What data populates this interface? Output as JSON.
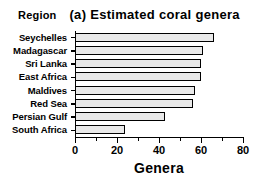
{
  "figure": {
    "panel_label": "(a)",
    "y_axis_title": "Region",
    "title": "(a) Estimated coral genera"
  },
  "chart_data": {
    "type": "bar",
    "orientation": "horizontal",
    "title": "(a) Estimated coral genera",
    "xlabel": "Genera",
    "ylabel": "Region",
    "categories": [
      "Seychelles",
      "Madagascar",
      "Sri Lanka",
      "East Africa",
      "Maldives",
      "Red Sea",
      "Persian Gulf",
      "South Africa"
    ],
    "values": [
      66,
      61,
      60,
      60,
      57,
      56,
      43,
      24
    ],
    "xlim": [
      0,
      80
    ],
    "xticks": [
      0,
      20,
      40,
      60,
      80
    ],
    "xtick_labels": [
      "0",
      "20",
      "40",
      "60",
      "80"
    ],
    "xminor_ticks": [
      10,
      30,
      50,
      70
    ],
    "grid": false,
    "legend": false,
    "bar_fill_color": "#e9e9e9",
    "bar_edge_color": "#000000"
  }
}
